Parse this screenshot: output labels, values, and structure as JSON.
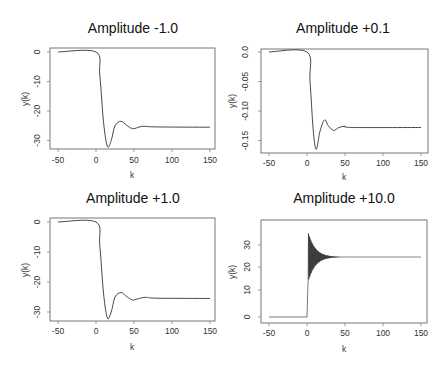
{
  "chart_data": [
    {
      "type": "line",
      "title": "Amplitude -1.0",
      "xlabel": "k",
      "ylabel": "y(k)",
      "xlim": [
        -50,
        150
      ],
      "ylim": [
        -32,
        0
      ],
      "xticks": [
        "-50",
        "0",
        "50",
        "100",
        "150"
      ],
      "yticks": [
        "0",
        "-10",
        "-20",
        "-30"
      ],
      "grid": false,
      "series": [
        {
          "name": "y(k)",
          "description": "0 for k<0, drops sharply after k=0 to min ~-32 at k~15, overshoot to ~-23.5 at k~33, settles at ~-25.5",
          "points": [
            [
              -50,
              0
            ],
            [
              0,
              0
            ],
            [
              5,
              -8
            ],
            [
              10,
              -24
            ],
            [
              15,
              -32
            ],
            [
              20,
              -30
            ],
            [
              25,
              -25
            ],
            [
              33,
              -23.5
            ],
            [
              40,
              -24.8
            ],
            [
              48,
              -26
            ],
            [
              55,
              -25.6
            ],
            [
              62,
              -25.2
            ],
            [
              80,
              -25.4
            ],
            [
              150,
              -25.5
            ]
          ]
        }
      ]
    },
    {
      "type": "line",
      "title": "Amplitude +0.1",
      "xlabel": "k",
      "ylabel": "y(k)",
      "xlim": [
        -50,
        150
      ],
      "ylim": [
        -0.165,
        0
      ],
      "xticks": [
        "-50",
        "0",
        "50",
        "100",
        "150"
      ],
      "yticks": [
        "0.0",
        "-0.05",
        "-0.10",
        "-0.15"
      ],
      "grid": false,
      "series": [
        {
          "name": "y(k)",
          "description": "0 for k<0, drops to min ~-0.165 at k~12, overshoot to ~-0.115 at k~23, settles at ~-0.128",
          "points": [
            [
              -50,
              0
            ],
            [
              0,
              0
            ],
            [
              4,
              -0.05
            ],
            [
              8,
              -0.13
            ],
            [
              12,
              -0.165
            ],
            [
              17,
              -0.135
            ],
            [
              23,
              -0.115
            ],
            [
              28,
              -0.125
            ],
            [
              35,
              -0.133
            ],
            [
              42,
              -0.128
            ],
            [
              50,
              -0.126
            ],
            [
              60,
              -0.128
            ],
            [
              150,
              -0.128
            ]
          ]
        }
      ]
    },
    {
      "type": "line",
      "title": "Amplitude +1.0",
      "xlabel": "k",
      "ylabel": "y(k)",
      "xlim": [
        -50,
        150
      ],
      "ylim": [
        -32,
        0
      ],
      "xticks": [
        "-50",
        "0",
        "50",
        "100",
        "150"
      ],
      "yticks": [
        "0",
        "-10",
        "-20",
        "-30"
      ],
      "grid": false,
      "series": [
        {
          "name": "y(k)",
          "description": "Nearly identical to the Amplitude -1.0 response",
          "points": [
            [
              -50,
              0
            ],
            [
              0,
              0
            ],
            [
              5,
              -8
            ],
            [
              10,
              -24
            ],
            [
              15,
              -32
            ],
            [
              20,
              -30
            ],
            [
              25,
              -25
            ],
            [
              33,
              -23.5
            ],
            [
              40,
              -24.8
            ],
            [
              48,
              -26
            ],
            [
              55,
              -25.6
            ],
            [
              65,
              -25.1
            ],
            [
              80,
              -25.4
            ],
            [
              150,
              -25.5
            ]
          ]
        }
      ]
    },
    {
      "type": "line",
      "title": "Amplitude +10.0",
      "xlabel": "k",
      "ylabel": "y(k)",
      "xlim": [
        -50,
        150
      ],
      "ylim": [
        0,
        35
      ],
      "xticks": [
        "-50",
        "0",
        "50",
        "100",
        "150"
      ],
      "yticks": [
        "0",
        "10",
        "20",
        "30"
      ],
      "grid": false,
      "series": [
        {
          "name": "y(k)",
          "description": "0 for k<0, jumps at k=0 to rapid decaying oscillation between ~12 and ~35 around 25, settles at ~25 by k~40",
          "points": [
            [
              -50,
              0
            ],
            [
              0,
              0
            ],
            [
              1,
              12
            ],
            [
              2,
              33
            ],
            [
              3,
              15
            ],
            [
              4,
              35
            ],
            [
              5,
              16
            ],
            [
              6,
              33
            ],
            [
              8,
              18
            ],
            [
              10,
              31
            ],
            [
              14,
              21
            ],
            [
              18,
              29
            ],
            [
              25,
              23.5
            ],
            [
              30,
              26.5
            ],
            [
              40,
              25.2
            ],
            [
              150,
              25
            ]
          ]
        }
      ]
    }
  ],
  "panels": [
    {
      "title": "Amplitude -1.0",
      "xlabel": "k",
      "ylabel": "y(k)"
    },
    {
      "title": "Amplitude +0.1",
      "xlabel": "k",
      "ylabel": "y(k)"
    },
    {
      "title": "Amplitude +1.0",
      "xlabel": "k",
      "ylabel": "y(k)"
    },
    {
      "title": "Amplitude +10.0",
      "xlabel": "k",
      "ylabel": "y(k)"
    }
  ]
}
